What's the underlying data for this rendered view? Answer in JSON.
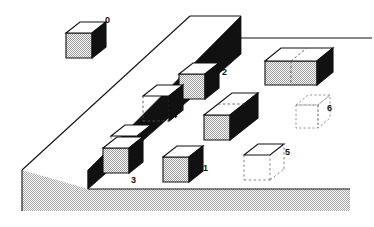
{
  "figure": {
    "canvas": {
      "width": 374,
      "height": 227
    },
    "colors": {
      "background": "#ffffff",
      "outline": "#111111",
      "cube_top": "#ffffff",
      "cube_front_fill": "#c9c9c9",
      "cube_side_dark": "#111111",
      "ground_fill": "#c9c9c9",
      "platform_top": "#ffffff",
      "wall_shadow": "#111111",
      "ghost_stroke": "#777777"
    },
    "projection": {
      "unit_px": 28,
      "depth_dx": 14,
      "depth_dy": -11
    }
  },
  "labels": [
    {
      "id": "label-0",
      "text": "0",
      "x": 105,
      "y": 16
    },
    {
      "id": "label-2",
      "text": "2",
      "x": 222,
      "y": 68
    },
    {
      "id": "label-4",
      "text": "4",
      "x": 172,
      "y": 111
    },
    {
      "id": "label-3",
      "text": "3",
      "x": 131,
      "y": 176
    },
    {
      "id": "label-1",
      "text": "1",
      "x": 203,
      "y": 167
    },
    {
      "id": "label-5",
      "text": "5",
      "x": 285,
      "y": 150
    },
    {
      "id": "label-6",
      "text": "6",
      "x": 327,
      "y": 108
    }
  ],
  "blocks": [
    {
      "id": "block-0",
      "label": "0",
      "style": "solid",
      "size": "1x1x1",
      "location": "floating above platform, upper left",
      "faces": {
        "top": "white",
        "front": "gray-dotted",
        "side": "black"
      }
    },
    {
      "id": "block-2",
      "label": "2",
      "style": "solid",
      "size": "1x1x1",
      "location": "on the diagonal wall, upper middle",
      "faces": {
        "top": "white",
        "front": "gray-dotted",
        "side": "black"
      }
    },
    {
      "id": "block-4",
      "label": "4",
      "style": "solid-with-hidden-edges",
      "size": "1x1x1",
      "location": "embedded in the wall, middle",
      "faces": {
        "top": "white",
        "front": "hidden",
        "side": "black"
      }
    },
    {
      "id": "block-3",
      "label": "3",
      "style": "solid",
      "size": "1x1x1",
      "location": "at the foot of the wall, lower left",
      "faces": {
        "top": "white",
        "front": "gray-dotted",
        "side": "black"
      }
    },
    {
      "id": "block-1",
      "label": "1",
      "style": "solid",
      "size": "1x1x1",
      "location": "on the lower ground, center",
      "faces": {
        "top": "white",
        "front": "gray-dotted",
        "side": "black"
      }
    },
    {
      "id": "block-5",
      "label": "5",
      "style": "outline-dashed",
      "size": "1x1x1",
      "location": "goal position, lower right",
      "faces": {
        "top": "white-outlined",
        "front": "dashed",
        "side": "dashed"
      }
    },
    {
      "id": "block-6",
      "label": "6",
      "style": "dashed-ghost",
      "size": "1x1x1",
      "location": "goal position, right",
      "faces": {
        "top": "dashed",
        "front": "dashed",
        "side": "dashed"
      }
    },
    {
      "id": "block-wide-unlabeled",
      "label": "",
      "style": "solid-2-wide",
      "size": "2x1x1",
      "location": "upper right, two cubes joined",
      "faces": {
        "top": "white",
        "front": "gray-dotted",
        "side": "black"
      }
    },
    {
      "id": "block-long-unlabeled",
      "label": "",
      "style": "solid-2-deep",
      "size": "1x1x2",
      "location": "center right, two cubes deep",
      "faces": {
        "top": "white",
        "front": "gray-dotted",
        "side": "black"
      }
    }
  ],
  "scene_parts": [
    {
      "id": "platform-top",
      "name": "raised-platform-top-surface",
      "fill": "white"
    },
    {
      "id": "platform-face",
      "name": "platform-left-face",
      "fill": "gray"
    },
    {
      "id": "wall-shadow",
      "name": "diagonal-wall-shadow-face",
      "fill": "black"
    },
    {
      "id": "ground-plane",
      "name": "lower-ground-plane",
      "fill": "gray"
    },
    {
      "id": "horizon-line",
      "name": "right-horizon-line",
      "fill": "none"
    }
  ]
}
